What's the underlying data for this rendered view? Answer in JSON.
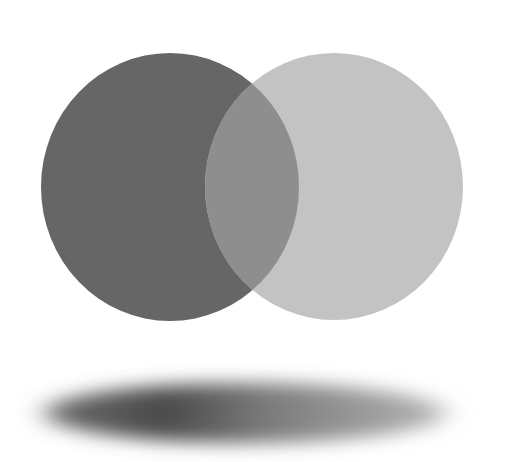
{
  "scene": {
    "background": "#ffffff",
    "circles": [
      {
        "name": "dark-circle",
        "color": "#666666",
        "cx": 170,
        "cy": 187,
        "rx": 129,
        "ry": 134
      },
      {
        "name": "light-circle",
        "color": "#c3c3c3",
        "cx": 334,
        "cy": 186.5,
        "rx": 129,
        "ry": 133.5
      }
    ],
    "overlap": {
      "color": "#8e8e8e"
    },
    "shadow": {
      "cx": 245,
      "cy": 413,
      "rx": 205,
      "ry": 34,
      "dark_color": "#4a4a4a",
      "light_color": "#9a9a9a"
    }
  }
}
